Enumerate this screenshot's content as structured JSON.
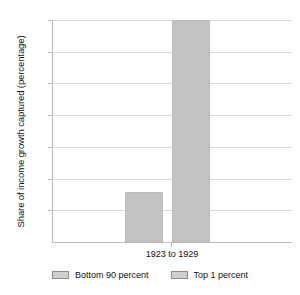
{
  "chart_data": {
    "type": "bar",
    "title": "",
    "xlabel": "",
    "ylabel": "Share of income growth captured (percentage)",
    "categories": [
      "1923 to 1929"
    ],
    "series": [
      {
        "name": "Bottom 90 percent",
        "values": [
          15.7
        ],
        "color": "#c3c3c3"
      },
      {
        "name": "Top 1 percent",
        "values": [
          70
        ],
        "color": "#c3c3c3"
      }
    ],
    "ylim": [
      0,
      70
    ],
    "yticks": [
      0,
      10,
      20,
      30,
      40,
      50,
      60,
      70
    ],
    "ytick_labels": [
      "",
      "10",
      "20",
      "30",
      "40",
      "50",
      "60",
      "70%"
    ],
    "grid": true,
    "legend_position": "bottom"
  },
  "axis": {
    "y_title": "Share of income growth captured (percentage)",
    "labels": {
      "t70": "70%",
      "t60": "60",
      "t50": "50",
      "t40": "40",
      "t30": "30",
      "t20": "20",
      "t10": "10"
    }
  },
  "category": {
    "label": "1923 to 1929"
  },
  "legend": {
    "items": [
      {
        "label": "Bottom 90 percent"
      },
      {
        "label": "Top 1 percent"
      }
    ]
  }
}
